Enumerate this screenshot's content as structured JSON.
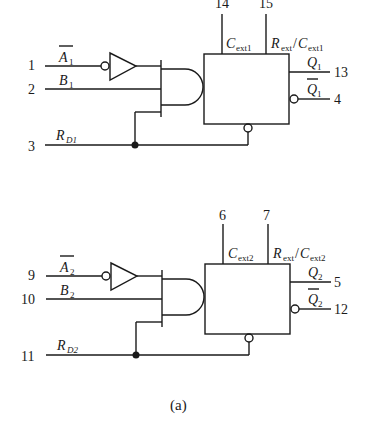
{
  "caption": "(a)",
  "circuits": [
    {
      "name": "monostable-1",
      "pins": {
        "a_bar": "1",
        "b": "2",
        "rd": "3",
        "cext": "14",
        "rext_cext": "15",
        "q": "13",
        "q_bar": "4"
      },
      "labels": {
        "a_main": "A",
        "a_sub": "1",
        "b_main": "B",
        "b_sub": "1",
        "rd_main": "R",
        "rd_sub": "D1",
        "cext_main": "C",
        "cext_sub": "ext1",
        "rext_main": "R",
        "rext_sub": "ext",
        "rext_slash": "/",
        "rext_c_main": "C",
        "rext_c_sub": "ext1",
        "q_main": "Q",
        "q_sub": "1",
        "qbar_main": "Q",
        "qbar_sub": "1"
      }
    },
    {
      "name": "monostable-2",
      "pins": {
        "a_bar": "9",
        "b": "10",
        "rd": "11",
        "cext": "6",
        "rext_cext": "7",
        "q": "5",
        "q_bar": "12"
      },
      "labels": {
        "a_main": "A",
        "a_sub": "2",
        "b_main": "B",
        "b_sub": "2",
        "rd_main": "R",
        "rd_sub": "D2",
        "cext_main": "C",
        "cext_sub": "ext2",
        "rext_main": "R",
        "rext_sub": "ext",
        "rext_slash": "/",
        "rext_c_main": "C",
        "rext_c_sub": "ext2",
        "q_main": "Q",
        "q_sub": "2",
        "qbar_main": "Q",
        "qbar_sub": "2"
      }
    }
  ]
}
